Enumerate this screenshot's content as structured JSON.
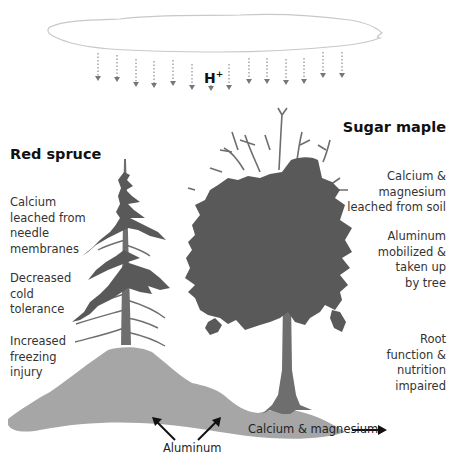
{
  "diagram": {
    "type": "illustration",
    "cloud": {
      "rain_label": "H",
      "rain_label_sup": "+"
    },
    "trees": {
      "red_spruce": {
        "title": "Red spruce",
        "effects": [
          [
            "Calcium",
            "leached from",
            "needle",
            "membranes"
          ],
          [
            "Decreased",
            "cold",
            "tolerance"
          ],
          [
            "Increased",
            "freezing",
            "injury"
          ]
        ]
      },
      "sugar_maple": {
        "title": "Sugar maple",
        "effects": [
          [
            "Calcium &",
            "magnesium",
            "leached from soil"
          ],
          [
            "Aluminum",
            "mobilized &",
            "taken up",
            "by tree"
          ],
          [
            "Root",
            "function &",
            "nutrition",
            "impaired"
          ]
        ]
      }
    },
    "soil": {
      "aluminum_label": "Aluminum",
      "calcium_label": "Calcium & magnesium"
    },
    "colors": {
      "foliage": "#595959",
      "trunk": "#6e6e6e",
      "soil": "#a6a6a6",
      "cloud_outline": "#c8c8c8",
      "rain": "#777777",
      "text": "#333333",
      "arrow": "#111111"
    }
  }
}
